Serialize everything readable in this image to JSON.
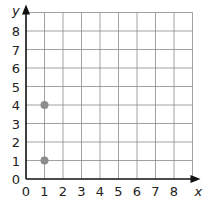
{
  "chart_data": {
    "type": "scatter",
    "title": "",
    "xlabel": "x",
    "ylabel": "y",
    "x_ticks": [
      "0",
      "1",
      "2",
      "3",
      "4",
      "5",
      "6",
      "7",
      "8"
    ],
    "y_ticks": [
      "0",
      "1",
      "2",
      "3",
      "4",
      "5",
      "6",
      "7",
      "8"
    ],
    "xlim": [
      0,
      9
    ],
    "ylim": [
      0,
      9
    ],
    "grid": true,
    "points": [
      {
        "x": 1,
        "y": 4
      },
      {
        "x": 1,
        "y": 1
      }
    ],
    "point_color": "#8c8c8c"
  }
}
